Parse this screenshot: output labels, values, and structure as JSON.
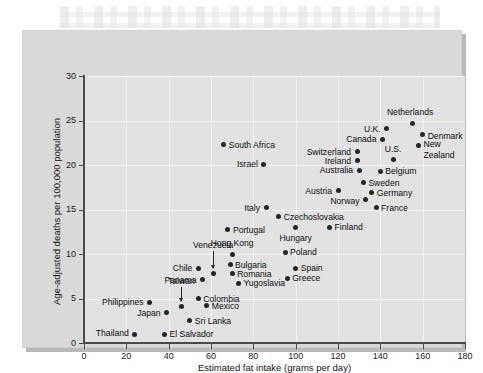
{
  "figure": {
    "background_color": "#d9d9d9",
    "plot_background_color": "#e2e2e2",
    "point_color": "#252525"
  },
  "chart_data": {
    "type": "scatter",
    "title": "",
    "xlabel": "Estimated fat intake (grams per day)",
    "ylabel": "Age-adjusted deaths per 100,000 population",
    "xlim": [
      0,
      180
    ],
    "ylim": [
      0,
      30
    ],
    "xticks": [
      0,
      20,
      40,
      60,
      80,
      100,
      120,
      140,
      160,
      180
    ],
    "yticks": [
      0,
      5,
      10,
      15,
      20,
      25,
      30
    ],
    "grid": true,
    "legend": "none",
    "points": [
      {
        "name": "Thailand",
        "x": 24,
        "y": 1.0,
        "label_pos": "r",
        "label_dx": -6,
        "label_dy": -1
      },
      {
        "name": "El Salvador",
        "x": 38,
        "y": 1.0,
        "label_pos": "l",
        "label_dx": 5,
        "label_dy": 0
      },
      {
        "name": "Sri Lanka",
        "x": 50,
        "y": 2.5,
        "label_pos": "l",
        "label_dx": 5,
        "label_dy": 0
      },
      {
        "name": "Japan",
        "x": 39,
        "y": 3.4,
        "label_pos": "r",
        "label_dx": -6,
        "label_dy": 0
      },
      {
        "name": "Mexico",
        "x": 58,
        "y": 4.2,
        "label_pos": "l",
        "label_dx": 5,
        "label_dy": 0
      },
      {
        "name": "Philippines",
        "x": 31,
        "y": 4.6,
        "label_pos": "r",
        "label_dx": -6,
        "label_dy": 0
      },
      {
        "name": "Taiwan",
        "x": 46,
        "y": 4.1,
        "label_pos": "c",
        "label_dx": 0,
        "label_dy": -26,
        "leader": true
      },
      {
        "name": "Colombia",
        "x": 54,
        "y": 5.0,
        "label_pos": "l",
        "label_dx": 5,
        "label_dy": 0
      },
      {
        "name": "Yugoslavia",
        "x": 73,
        "y": 6.7,
        "label_pos": "l",
        "label_dx": 5,
        "label_dy": 0
      },
      {
        "name": "Panama",
        "x": 56,
        "y": 7.1,
        "label_pos": "r",
        "label_dx": -6,
        "label_dy": 0
      },
      {
        "name": "Greece",
        "x": 96,
        "y": 7.3,
        "label_pos": "l",
        "label_dx": 5,
        "label_dy": 0
      },
      {
        "name": "Romania",
        "x": 70,
        "y": 7.8,
        "label_pos": "l",
        "label_dx": 5,
        "label_dy": 0
      },
      {
        "name": "Chile",
        "x": 54,
        "y": 8.4,
        "label_pos": "r",
        "label_dx": -6,
        "label_dy": 0
      },
      {
        "name": "Spain",
        "x": 100,
        "y": 8.4,
        "label_pos": "l",
        "label_dx": 5,
        "label_dy": 0
      },
      {
        "name": "Bulgaria",
        "x": 69,
        "y": 8.8,
        "label_pos": "l",
        "label_dx": 5,
        "label_dy": 0
      },
      {
        "name": "Venezuela",
        "x": 61,
        "y": 7.8,
        "label_pos": "c",
        "label_dx": 0,
        "label_dy": -29,
        "leader": true
      },
      {
        "name": "Hong Kong",
        "x": 70,
        "y": 10.0,
        "label_pos": "c",
        "label_dx": 0,
        "label_dy": -11
      },
      {
        "name": "Poland",
        "x": 95,
        "y": 10.2,
        "label_pos": "l",
        "label_dx": 5,
        "label_dy": 0
      },
      {
        "name": "Portugal",
        "x": 68,
        "y": 12.7,
        "label_pos": "l",
        "label_dx": 5,
        "label_dy": 0
      },
      {
        "name": "Hungary",
        "x": 100,
        "y": 13.0,
        "label_pos": "c",
        "label_dx": 0,
        "label_dy": 11
      },
      {
        "name": "Finland",
        "x": 116,
        "y": 13.0,
        "label_pos": "l",
        "label_dx": 5,
        "label_dy": 0
      },
      {
        "name": "Czechoslovakia",
        "x": 92,
        "y": 14.2,
        "label_pos": "l",
        "label_dx": 5,
        "label_dy": 0
      },
      {
        "name": "Italy",
        "x": 86,
        "y": 15.2,
        "label_pos": "r",
        "label_dx": -6,
        "label_dy": 0
      },
      {
        "name": "France",
        "x": 138,
        "y": 15.2,
        "label_pos": "l",
        "label_dx": 5,
        "label_dy": 0
      },
      {
        "name": "Norway",
        "x": 133,
        "y": 16.1,
        "label_pos": "r",
        "label_dx": -6,
        "label_dy": 1
      },
      {
        "name": "Germany",
        "x": 136,
        "y": 16.9,
        "label_pos": "l",
        "label_dx": 5,
        "label_dy": 0
      },
      {
        "name": "Austria",
        "x": 120,
        "y": 17.1,
        "label_pos": "r",
        "label_dx": -6,
        "label_dy": 0
      },
      {
        "name": "Sweden",
        "x": 132,
        "y": 18.0,
        "label_pos": "l",
        "label_dx": 5,
        "label_dy": 0
      },
      {
        "name": "Belgium",
        "x": 140,
        "y": 19.3,
        "label_pos": "l",
        "label_dx": 5,
        "label_dy": 0
      },
      {
        "name": "Australia",
        "x": 130,
        "y": 19.4,
        "label_pos": "r",
        "label_dx": -6,
        "label_dy": 0
      },
      {
        "name": "Israel",
        "x": 85,
        "y": 20.1,
        "label_pos": "r",
        "label_dx": -6,
        "label_dy": 0
      },
      {
        "name": "Ireland",
        "x": 129,
        "y": 20.5,
        "label_pos": "r",
        "label_dx": -6,
        "label_dy": 0
      },
      {
        "name": "U.S.",
        "x": 146,
        "y": 20.6,
        "label_pos": "c",
        "label_dx": 0,
        "label_dy": -11
      },
      {
        "name": "Switzerland",
        "x": 129,
        "y": 21.5,
        "label_pos": "r",
        "label_dx": -6,
        "label_dy": 0
      },
      {
        "name": "New",
        "x": 158,
        "y": 22.2,
        "label_pos": "l",
        "label_dx": 5,
        "label_dy": -1
      },
      {
        "name": "Zealand",
        "x": 158,
        "y": 22.2,
        "label_pos": "l",
        "label_dx": 5,
        "label_dy": 10,
        "no_dot": true
      },
      {
        "name": "South Africa",
        "x": 66,
        "y": 22.3,
        "label_pos": "l",
        "label_dx": 5,
        "label_dy": 0
      },
      {
        "name": "Canada",
        "x": 141,
        "y": 22.9,
        "label_pos": "r",
        "label_dx": -6,
        "label_dy": 0
      },
      {
        "name": "Denmark",
        "x": 160,
        "y": 23.4,
        "label_pos": "l",
        "label_dx": 5,
        "label_dy": 1
      },
      {
        "name": "U.K.",
        "x": 143,
        "y": 24.1,
        "label_pos": "r",
        "label_dx": -6,
        "label_dy": 0
      },
      {
        "name": "Netherlands",
        "x": 155,
        "y": 24.7,
        "label_pos": "c",
        "label_dx": -2,
        "label_dy": -11
      }
    ]
  }
}
